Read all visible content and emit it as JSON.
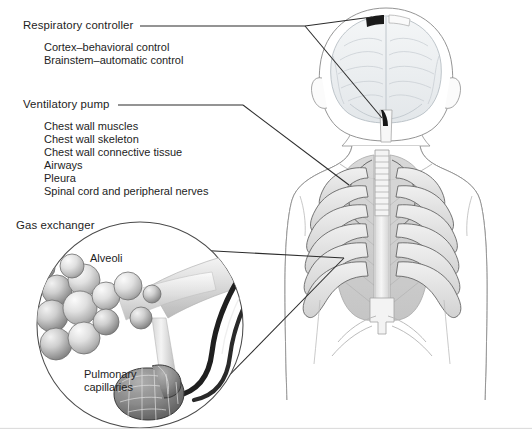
{
  "figure": {
    "background_color": "#ffffff",
    "text_color": "#1d1d1d",
    "line_color": "#2b2b2b"
  },
  "annotations": {
    "respiratory_controller": {
      "heading": "Respiratory controller",
      "items": [
        "Cortex–behavioral control",
        "Brainstem–automatic control"
      ]
    },
    "ventilatory_pump": {
      "heading": "Ventilatory pump",
      "items": [
        "Chest wall muscles",
        "Chest wall skeleton",
        "Chest wall connective tissue",
        "Airways",
        "Pleura",
        "Spinal cord and peripheral nerves"
      ]
    },
    "gas_exchanger": {
      "heading": "Gas exchanger",
      "items": []
    }
  },
  "inset": {
    "alveoli_label": "Alveoli",
    "capillaries_label_line1": "Pulmonary",
    "capillaries_label_line2": "capillaries"
  },
  "anatomy": {
    "head": "posterior view of head with translucent brain",
    "cortex_marker": "dark shaded cortex region at vertex",
    "brainstem_marker": "dark shaded brainstem region",
    "torso": "anterior view of upper torso with rib cage, lungs, trachea and spine",
    "inset_circle": "magnified view of alveoli and pulmonary capillaries"
  }
}
